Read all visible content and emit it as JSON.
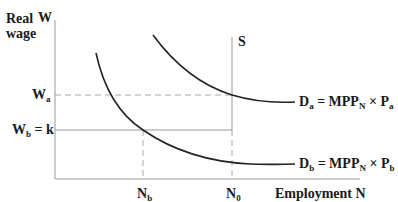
{
  "axes": {
    "y_label_line1": "Real",
    "y_label_line2": "wage",
    "y_symbol": "W",
    "x_label": "Employment N"
  },
  "levels": {
    "wa": {
      "main": "W",
      "sub": "a"
    },
    "wb": {
      "main": "W",
      "sub": "b",
      "suffix": " = k"
    },
    "nb": {
      "main": "N",
      "sub": "b"
    },
    "n0": {
      "main": "N",
      "sub": "0"
    }
  },
  "curves": {
    "supply": "S",
    "da": {
      "d": "D",
      "dsub": "a",
      "eq": " = MPP",
      "msub": "N",
      "times": " × P",
      "psub": "a"
    },
    "db": {
      "d": "D",
      "dsub": "b",
      "eq": " = MPP",
      "msub": "N",
      "times": " × P",
      "psub": "b"
    }
  },
  "colors": {
    "curve": "#222222",
    "axis": "#999999",
    "guide": "#aaaaaa"
  }
}
